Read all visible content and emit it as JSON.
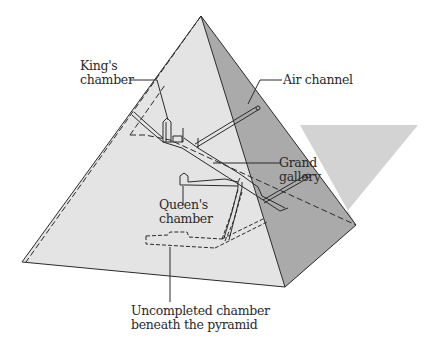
{
  "diagram": {
    "colors": {
      "background": "#ffffff",
      "front_face": "#e3e3e3",
      "right_face": "#a9a9a9",
      "shadow": "#d2d2d2",
      "line": "#2a2a2a",
      "text": "#2a2a2a"
    },
    "labels": {
      "kings_chamber": {
        "line1": "King's",
        "line2": "chamber"
      },
      "air_channel": {
        "line1": "Air channel"
      },
      "grand_gallery": {
        "line1": "Grand",
        "line2": "gallery"
      },
      "queens_chamber": {
        "line1": "Queen's",
        "line2": "chamber"
      },
      "uncompleted_chamber": {
        "line1": "Uncompleted chamber",
        "line2": "beneath the pyramid"
      }
    }
  }
}
